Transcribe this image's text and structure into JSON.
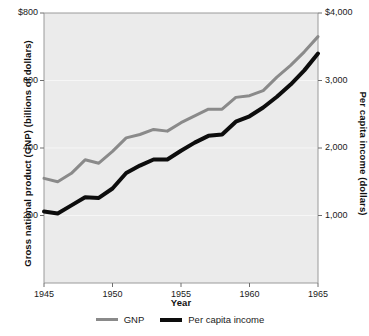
{
  "chart_data": {
    "type": "line",
    "title": "",
    "xlabel": "Year",
    "ylabel": "Gross national product (GNP) (billions of dollars)",
    "y2label": "Per capita income (dollars)",
    "x": [
      1945,
      1946,
      1947,
      1948,
      1949,
      1950,
      1951,
      1952,
      1953,
      1954,
      1955,
      1956,
      1957,
      1958,
      1959,
      1960,
      1961,
      1962,
      1963,
      1964,
      1965
    ],
    "xlim": [
      1945,
      1965
    ],
    "xticks": [
      1945,
      1950,
      1955,
      1960,
      1965
    ],
    "xticklabels": [
      "1945",
      "1950",
      "1955",
      "1960",
      "1965"
    ],
    "ylim": [
      0,
      800
    ],
    "yticks": [
      200,
      400,
      600,
      800
    ],
    "yticklabels": [
      "200",
      "400",
      "600",
      "$800"
    ],
    "y2lim": [
      0,
      4000
    ],
    "y2ticks": [
      1000,
      2000,
      3000,
      4000
    ],
    "y2ticklabels": [
      "1,000",
      "2,000",
      "3,000",
      "$4,000"
    ],
    "grid": true,
    "grid_axis": "y",
    "legend_position": "bottom-center",
    "plot_background": "#ebebeb",
    "series": [
      {
        "name": "GNP",
        "axis": "left",
        "color": "#8a8a8a",
        "width": 3,
        "values": [
          310,
          300,
          325,
          365,
          355,
          390,
          430,
          440,
          455,
          450,
          475,
          495,
          515,
          515,
          550,
          555,
          570,
          610,
          645,
          685,
          730
        ]
      },
      {
        "name": "Per capita income",
        "axis": "right",
        "color": "#0d0d0d",
        "width": 4,
        "values": [
          1060,
          1030,
          1150,
          1270,
          1260,
          1400,
          1630,
          1740,
          1830,
          1830,
          1960,
          2080,
          2180,
          2200,
          2390,
          2470,
          2600,
          2760,
          2940,
          3150,
          3400
        ]
      }
    ]
  },
  "axes": {
    "y_left_title": "Gross national product (GNP) (billions of dollars)",
    "y_right_title": "Per capita income (dollars)",
    "x_title": "Year"
  },
  "legend": {
    "items": [
      {
        "label": "GNP",
        "color": "#8a8a8a"
      },
      {
        "label": "Per capita income",
        "color": "#0d0d0d"
      }
    ]
  }
}
